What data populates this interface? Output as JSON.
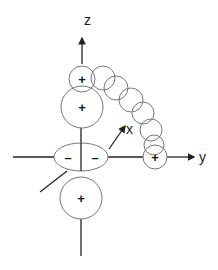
{
  "diagram": {
    "type": "orbital-diagram",
    "axes": {
      "z_label": "z",
      "y_label": "y",
      "x_label": "x"
    },
    "lobes": {
      "top_small_sign": "+",
      "top_large_sign": "+",
      "bottom_large_sign": "+",
      "right_small_sign": "+",
      "torus_left_sign": "–",
      "torus_right_sign": "–"
    },
    "colors": {
      "stroke": "#555555",
      "axis": "#222222",
      "text": "#111111"
    }
  }
}
